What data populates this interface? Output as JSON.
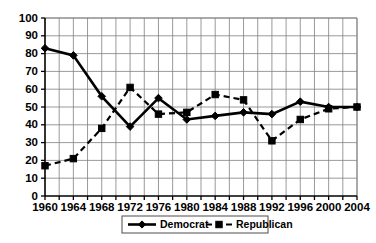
{
  "chart_data": {
    "type": "line",
    "title": "",
    "subtitle": "",
    "xlabel": "",
    "ylabel": "",
    "x": [
      1960,
      1964,
      1968,
      1972,
      1976,
      1980,
      1984,
      1988,
      1992,
      1996,
      2000,
      2004
    ],
    "categories": [
      "1960",
      "1964",
      "1968",
      "1972",
      "1976",
      "1980",
      "1984",
      "1988",
      "1992",
      "1996",
      "2000",
      "2004"
    ],
    "series": [
      {
        "name": "Democrat",
        "marker": "diamond",
        "linestyle": "solid",
        "color": "#000000",
        "values": [
          83,
          79,
          56,
          39,
          55,
          43,
          45,
          47,
          46,
          53,
          50,
          50
        ]
      },
      {
        "name": "Republican",
        "marker": "square",
        "linestyle": "dashed",
        "color": "#000000",
        "values": [
          17,
          21,
          38,
          61,
          46,
          47,
          57,
          54,
          31,
          43,
          49,
          50
        ]
      }
    ],
    "xlim": [
      1960,
      2004
    ],
    "ylim": [
      0,
      100
    ],
    "ytick_labels": [
      "0",
      "10",
      "20",
      "30",
      "40",
      "50",
      "60",
      "70",
      "80",
      "90",
      "100"
    ],
    "yticks": [
      0,
      10,
      20,
      30,
      40,
      50,
      60,
      70,
      80,
      90,
      100
    ],
    "xtick_labels": [
      "1960",
      "1964",
      "1968",
      "1972",
      "1976",
      "1980",
      "1984",
      "1988",
      "1992",
      "1996",
      "2000",
      "2004"
    ],
    "xticks": [
      1960,
      1964,
      1968,
      1972,
      1976,
      1980,
      1984,
      1988,
      1992,
      1996,
      2000,
      2004
    ],
    "x_minor_step": 2,
    "grid": true,
    "grid_color": "#808080",
    "legend_position": "bottom-center",
    "legend_entries": [
      "Democrat",
      "Republican"
    ],
    "background": "#ffffff"
  },
  "legend": {
    "democrat_label": "Democrat",
    "republican_label": "Republican"
  }
}
